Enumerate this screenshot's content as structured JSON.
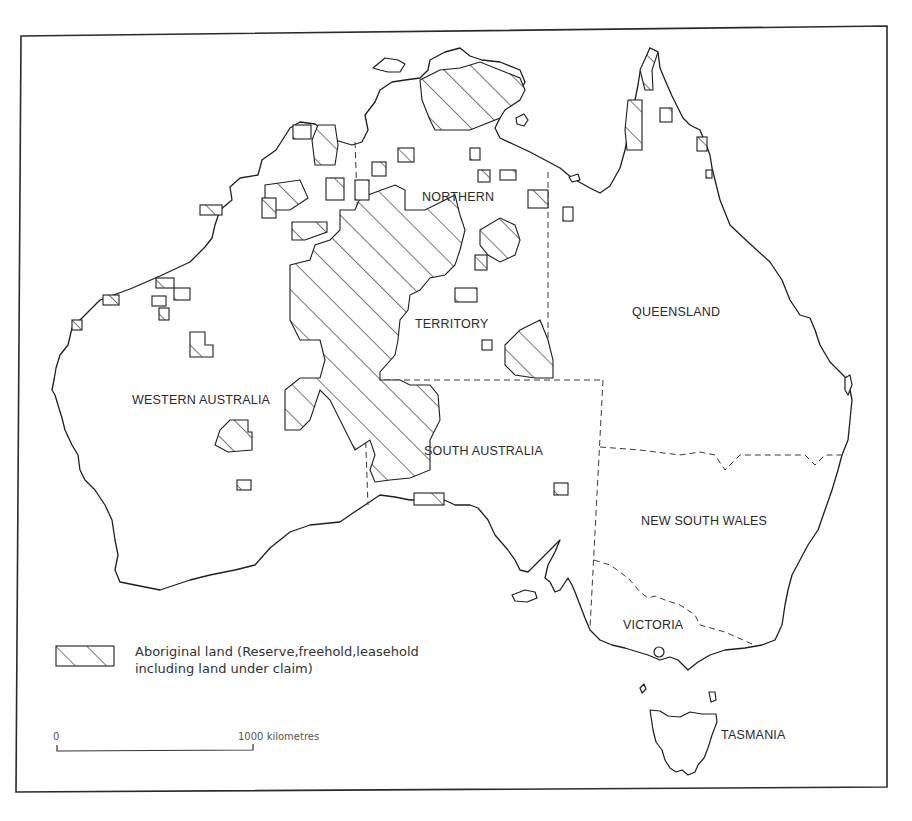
{
  "map": {
    "title": "Aboriginal land in Australia",
    "labels": {
      "nt_line1": "NORTHERN",
      "nt_line2": "TERRITORY",
      "qld": "QUEENSLAND",
      "wa": "WESTERN AUSTRALIA",
      "sa": "SOUTH AUSTRALIA",
      "nsw": "NEW SOUTH WALES",
      "vic": "VICTORIA",
      "tas": "TASMANIA"
    },
    "legend": {
      "symbol": "diagonal-hatch",
      "line1": "Aboriginal land (Reserve,freehold,leasehold",
      "line2": "including land under claim)"
    },
    "scale": {
      "start_label": "0",
      "end_label": "1000 kilometres"
    },
    "colors": {
      "ink": "#1e1e1e",
      "background": "#ffffff",
      "border_dash": "#3a3a3a"
    }
  }
}
